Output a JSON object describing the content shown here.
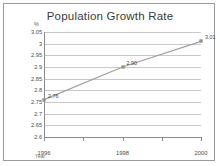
{
  "chart_data": {
    "type": "line",
    "title": "Population Growth Rate",
    "xlabel": "Year",
    "ylabel": "%",
    "x": [
      1996,
      1997,
      1998,
      1999,
      2000
    ],
    "categories": [
      "1996",
      "1997",
      "1998",
      "1999",
      "2000"
    ],
    "series": [
      {
        "name": "Population Growth Rate",
        "values": [
          2.76,
          null,
          2.9,
          null,
          3.01
        ],
        "labeled_points": [
          {
            "x": "1996",
            "y": 2.76,
            "label": "2.76"
          },
          {
            "x": "1998",
            "y": 2.9,
            "label": "2.90"
          },
          {
            "x": "2000",
            "y": 3.01,
            "label": "3.01"
          }
        ]
      }
    ],
    "ylim": [
      2.6,
      3.05
    ],
    "ytick_labels": [
      "3.05",
      "3",
      "2.95",
      "2.9",
      "2.85",
      "2.8",
      "2.75",
      "2.7",
      "2.65",
      "2.6"
    ],
    "ytick_values": [
      3.05,
      3.0,
      2.95,
      2.9,
      2.85,
      2.8,
      2.75,
      2.7,
      2.65,
      2.6
    ],
    "xtick_labels": [
      "1996",
      "1998",
      "2000"
    ],
    "xtick_values": [
      1996,
      1998,
      2000
    ],
    "grid": true,
    "legend": false,
    "line_color": "#a0a0a0",
    "marker_color": "#a8a8a8",
    "grid_color": "#c9c9c9",
    "axis_color": "#8c8c8c",
    "title_color": "#3a3a3a",
    "background": "#ffffff",
    "border_color": "#9a9a9a"
  }
}
